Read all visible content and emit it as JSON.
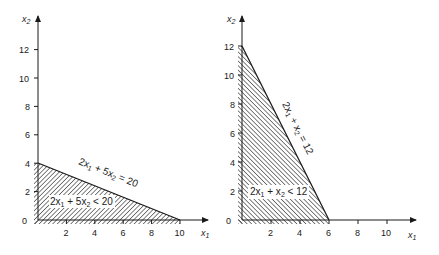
{
  "colors": {
    "ink": "#1a1a1a",
    "background": "#ffffff"
  },
  "left_plot": {
    "y_axis_label": "x",
    "y_axis_sub": "2",
    "x_axis_label": "x",
    "x_axis_sub": "1",
    "y_ticks": [
      "0",
      "2",
      "4",
      "6",
      "8",
      "10",
      "12"
    ],
    "x_ticks": [
      "2",
      "4",
      "6",
      "8",
      "10"
    ],
    "line_label": {
      "p1": "2x",
      "s1": "1",
      "p2": " + 5x",
      "s2": "2",
      "p3": " = 20"
    },
    "region_label": {
      "p1": "2x",
      "s1": "1",
      "p2": " + 5x",
      "s2": "2",
      "p3": " < 20"
    }
  },
  "right_plot": {
    "y_axis_label": "x",
    "y_axis_sub": "2",
    "x_axis_label": "x",
    "x_axis_sub": "1",
    "y_ticks": [
      "0",
      "2",
      "4",
      "6",
      "8",
      "10",
      "12"
    ],
    "x_ticks": [
      "2",
      "4",
      "6",
      "8",
      "10"
    ],
    "line_label": {
      "p1": "2x",
      "s1": "1",
      "p2": " + x",
      "s2": "2",
      "p3": " = 12"
    },
    "region_label": {
      "p1": "2x",
      "s1": "1",
      "p2": " + x",
      "s2": "2",
      "p3": " < 12"
    }
  }
}
